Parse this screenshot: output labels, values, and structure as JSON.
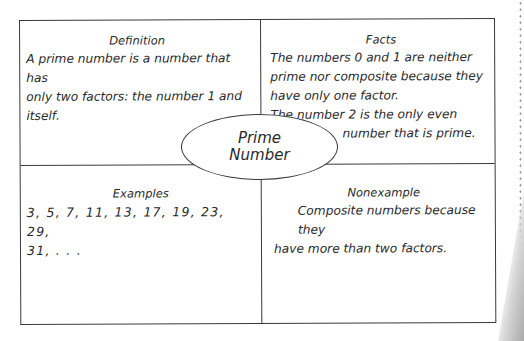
{
  "diagram": {
    "type": "frayer-model",
    "center_label": {
      "line1": "Prime",
      "line2": "Number"
    },
    "definition": {
      "heading": "Definition",
      "lines": [
        "A prime number is a number that has",
        "only two factors: the number 1 and",
        "itself."
      ]
    },
    "facts": {
      "heading": "Facts",
      "lines": [
        "The numbers 0 and 1 are neither",
        "prime nor composite because they",
        "have only one factor.",
        "The number 2 is the only even",
        "number that is prime."
      ]
    },
    "examples": {
      "heading": "Examples",
      "lines": [
        "3, 5, 7, 11, 13, 17, 19, 23, 29,",
        "31, . . ."
      ]
    },
    "nonexample": {
      "heading": "Nonexample",
      "lines": [
        "Composite numbers because they",
        "have more than two factors."
      ]
    }
  },
  "colors": {
    "line": "#3a3a3a",
    "text": "#2a2a2a",
    "background": "#ffffff"
  }
}
